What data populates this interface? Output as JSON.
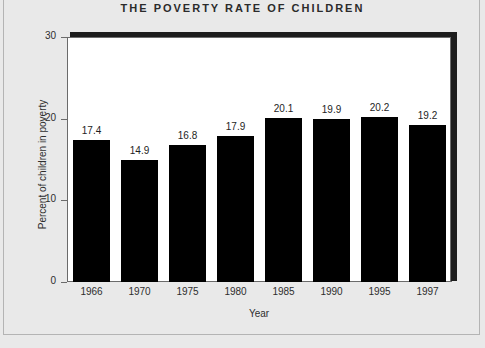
{
  "chart_data": {
    "type": "bar",
    "title": "THE POVERTY RATE OF CHILDREN",
    "xlabel": "Year",
    "ylabel": "Percent of children in poverty",
    "categories": [
      "1966",
      "1970",
      "1975",
      "1980",
      "1985",
      "1990",
      "1995",
      "1997"
    ],
    "values": [
      17.4,
      14.9,
      16.8,
      17.9,
      20.1,
      19.9,
      20.2,
      19.2
    ],
    "value_labels": [
      "17.4",
      "14.9",
      "16.8",
      "17.9",
      "20.1",
      "19.9",
      "20.2",
      "19.2"
    ],
    "ylim": [
      0,
      30
    ],
    "yticks": [
      0,
      10,
      20,
      30
    ],
    "ytick_labels": [
      "0",
      "10",
      "20",
      "30"
    ],
    "grid": false,
    "legend": null,
    "bar_color": "#000000",
    "plot_background": "#ffffff",
    "page_background": "#e9e9e9"
  }
}
